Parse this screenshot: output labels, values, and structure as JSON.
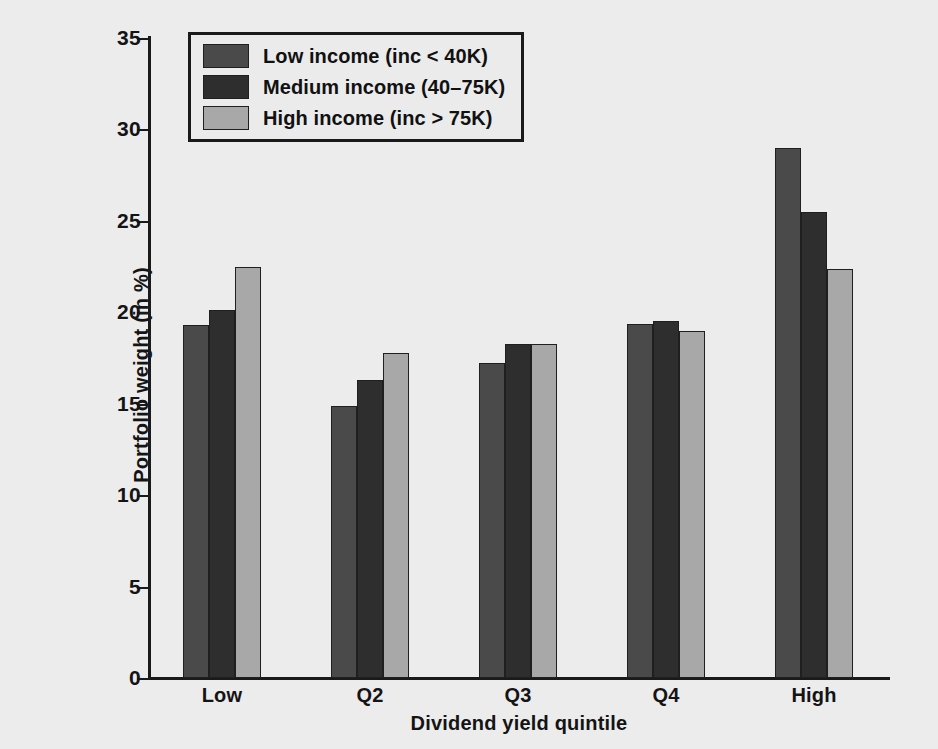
{
  "chart_data": {
    "type": "bar",
    "title": "",
    "xlabel": "Dividend yield quintile",
    "ylabel": "Portfolio weight (in %)",
    "categories": [
      "Low",
      "Q2",
      "Q3",
      "Q4",
      "High"
    ],
    "ylim": [
      0,
      35
    ],
    "yticks": [
      0,
      5,
      10,
      15,
      20,
      25,
      30,
      35
    ],
    "ytick_labels": [
      "0",
      "5",
      "10",
      "15",
      "20",
      "25",
      "30",
      "35"
    ],
    "grid": false,
    "legend_position": "upper left",
    "series": [
      {
        "name": "Low income (inc < 40K)",
        "color": "#4a4a4a",
        "values": [
          19.3,
          14.85,
          17.25,
          19.35,
          29.0
        ]
      },
      {
        "name": "Medium income (40–75K)",
        "color": "#2e2e2e",
        "values": [
          20.15,
          16.3,
          18.25,
          19.55,
          25.5
        ]
      },
      {
        "name": "High income (inc > 75K)",
        "color": "#a8a8a8",
        "values": [
          22.5,
          17.8,
          18.25,
          19.0,
          22.35
        ]
      }
    ]
  },
  "figure": {
    "background_color": "#ececed",
    "axis_color": "#1a1a1a"
  }
}
